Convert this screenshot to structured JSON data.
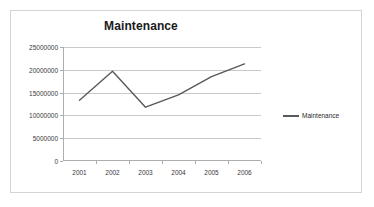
{
  "chart": {
    "title": "Maintenance",
    "legend_label": "Maintenance",
    "line_color": "#595959",
    "grid_color": "#c9c9c9",
    "axis_color": "#aeaeae",
    "border_color": "#d4d4d4",
    "background": "#ffffff"
  },
  "chart_data": {
    "type": "line",
    "title": "Maintenance",
    "xlabel": "",
    "ylabel": "",
    "categories": [
      "2001",
      "2002",
      "2003",
      "2004",
      "2005",
      "2006"
    ],
    "series": [
      {
        "name": "Maintenance",
        "values": [
          13300000,
          19700000,
          11800000,
          14500000,
          18500000,
          21300000
        ]
      }
    ],
    "ylim": [
      0,
      25000000
    ],
    "yticks": [
      0,
      5000000,
      10000000,
      15000000,
      20000000,
      25000000
    ],
    "ytick_labels": [
      "0",
      "5000000",
      "10000000",
      "15000000",
      "20000000",
      "25000000"
    ],
    "grid": true,
    "grid_axis": "y",
    "legend": true,
    "legend_position": "right",
    "markers": false
  }
}
